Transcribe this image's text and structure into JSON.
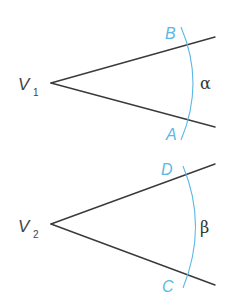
{
  "colors": {
    "ray": "#3a3a3a",
    "arc": "#5bb8e6",
    "label": "#444444"
  },
  "angles": [
    {
      "vertex_label": "V",
      "vertex_subscript": "1",
      "upper_point": "B",
      "lower_point": "A",
      "angle_symbol": "α"
    },
    {
      "vertex_label": "V",
      "vertex_subscript": "2",
      "upper_point": "D",
      "lower_point": "C",
      "angle_symbol": "β"
    }
  ]
}
